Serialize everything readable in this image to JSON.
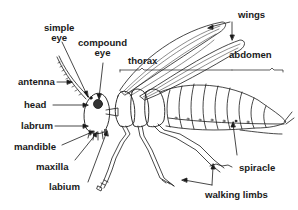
{
  "diagram": {
    "colors": {
      "line": "#1a1a1a",
      "background": "#ffffff"
    },
    "labels": {
      "simple_eye": [
        "simple",
        "eye"
      ],
      "compound_eye": [
        "compound",
        "eye"
      ],
      "wings": "wings",
      "thorax": "thorax",
      "abdomen": "abdomen",
      "antenna": "antenna",
      "head": "head",
      "labrum": "labrum",
      "mandible": "mandible",
      "maxilla": "maxilla",
      "labium": "labium",
      "spiracle": "spiracle",
      "walking_limbs": "walking limbs"
    }
  }
}
